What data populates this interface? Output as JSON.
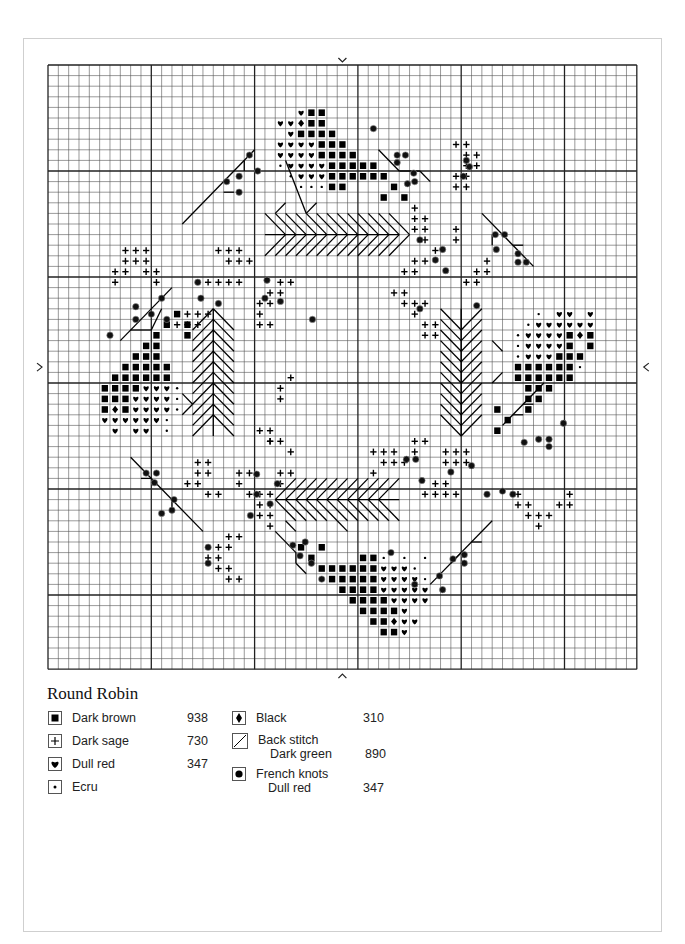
{
  "document": {
    "title": "Round Robin",
    "grid": {
      "columns": 57,
      "rows": 57,
      "major_every": 10
    },
    "center_markers": [
      "top",
      "bottom",
      "left",
      "right"
    ]
  },
  "legend": {
    "left": [
      {
        "symbol": "square",
        "name": "Dark brown",
        "code": "938"
      },
      {
        "symbol": "plus",
        "name": "Dark sage",
        "code": "730"
      },
      {
        "symbol": "heart",
        "name": "Dull red",
        "code": "347"
      },
      {
        "symbol": "dot",
        "name": "Ecru",
        "code": ""
      }
    ],
    "right": [
      {
        "symbol": "diamond",
        "name": "Black",
        "sub": "",
        "code": "310"
      },
      {
        "symbol": "backstitch",
        "name": "Back stitch",
        "sub": "Dark green",
        "code": "890"
      },
      {
        "symbol": "knot",
        "name": "French knots",
        "sub": "Dull red",
        "code": "347"
      }
    ]
  },
  "chart_data": {
    "type": "heatmap",
    "title": "Round Robin",
    "grid_size": [
      57,
      57
    ],
    "symbols": {
      "S": "Dark brown 938",
      "H": "Dull red 347",
      "D": "Black 310",
      "P": "Dark sage 730",
      "E": "Ecru"
    },
    "cells": [
      {
        "r": 4,
        "row": "..HSS"
      },
      {
        "r": 5,
        "row": ".HHDSS"
      },
      {
        "r": 6,
        "row": "..HSSSS"
      },
      {
        "r": 7,
        "row": ".HHHHSSS"
      },
      {
        "r": 8,
        "row": ".HHHHSSSS"
      },
      {
        "r": 9,
        "row": "EHHHHSSSSS"
      },
      {
        "r": 10,
        "row": ".EHHHSSSSSS"
      },
      {
        "r": 11,
        "row": "..EEESS....S"
      },
      {
        "r": 12,
        "row": "..........S.S"
      }
    ],
    "motifs": {
      "top": {
        "origin": [
          22,
          4
        ]
      },
      "left": {
        "origin": [
          5,
          23
        ]
      },
      "right": {
        "origin": [
          44,
          22
        ]
      },
      "bottom": {
        "origin": [
          22,
          44
        ]
      }
    }
  }
}
